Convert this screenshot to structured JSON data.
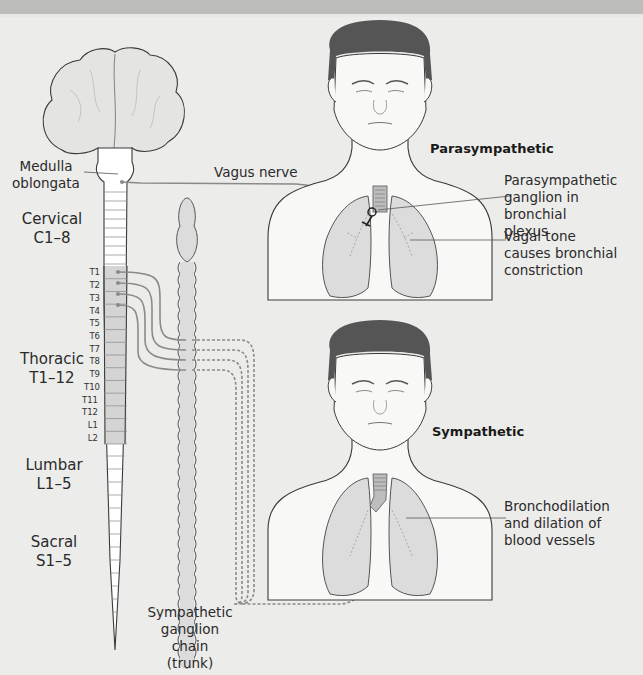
{
  "labels": {
    "medulla": [
      "Medulla",
      "oblongata"
    ],
    "cervical": [
      "Cervical",
      "C1–8"
    ],
    "thoracic": [
      "Thoracic",
      "T1–12"
    ],
    "lumbar": [
      "Lumbar",
      "L1–5"
    ],
    "sacral": [
      "Sacral",
      "S1–5"
    ],
    "ganglion_chain": [
      "Sympathetic",
      "ganglion chain",
      "(trunk)"
    ],
    "vagus": "Vagus nerve",
    "parasympathetic_title": "Parasympathetic",
    "parasympathetic_ganglion": [
      "Parasympathetic",
      "ganglion in bronchial",
      "plexus"
    ],
    "vagal_tone": [
      "Vagal tone",
      "causes bronchial",
      "constriction"
    ],
    "sympathetic_title": "Sympathetic",
    "bronchodilation": [
      "Bronchodilation",
      "and dilation of",
      "blood vessels"
    ]
  },
  "segments": [
    "T1",
    "T2",
    "T3",
    "T4",
    "T5",
    "T6",
    "T7",
    "T8",
    "T9",
    "T10",
    "T11",
    "T12",
    "L1",
    "L2"
  ],
  "colors": {
    "background": "#ececea",
    "outline": "#3a3a3a",
    "nerve": "#8a8a8a",
    "hair": "#555555",
    "lung": "#dcdcdc",
    "cord_shade": "#d4d4d4"
  }
}
